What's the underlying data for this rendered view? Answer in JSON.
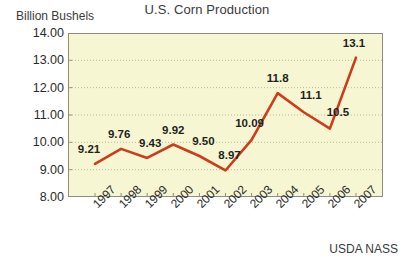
{
  "chart_title": "U.S. Corn Production",
  "y_axis_title": "Billion Bushels",
  "source_note": "USDA NASS",
  "colors": {
    "line": "#cc3d1c",
    "plot_background": "#f7f6d2",
    "plot_border": "#8e8e7a",
    "gridline": "#b9b9a0",
    "text": "#2b2b2b"
  },
  "chart_data": {
    "type": "line",
    "title": "U.S. Corn Production",
    "xlabel": "",
    "ylabel": "Billion Bushels",
    "ylim": [
      8.0,
      14.0
    ],
    "ytick_labels": [
      "14.00",
      "13.00",
      "12.00",
      "11.00",
      "10.00",
      "9.00",
      "8.00"
    ],
    "ytick_values": [
      14.0,
      13.0,
      12.0,
      11.0,
      10.0,
      9.0,
      8.0
    ],
    "grid": true,
    "legend": false,
    "categories": [
      "1997",
      "1998",
      "1999",
      "2000",
      "2001",
      "2002",
      "2003",
      "2004",
      "2005",
      "2006",
      "2007"
    ],
    "values": [
      9.21,
      9.76,
      9.43,
      9.92,
      9.5,
      8.97,
      10.09,
      11.8,
      11.1,
      10.5,
      13.1
    ],
    "data_labels": [
      "9.21",
      "9.76",
      "9.43",
      "9.92",
      "9.50",
      "8.97",
      "10.09",
      "11.8",
      "11.1",
      "10.5",
      "13.1"
    ],
    "annotations": [
      "USDA NASS"
    ]
  }
}
